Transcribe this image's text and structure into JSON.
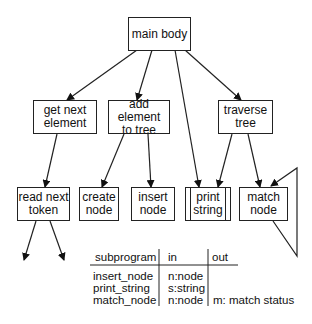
{
  "diagram": {
    "type": "structure chart",
    "nodes": [
      {
        "id": "main_body",
        "label": "main body"
      },
      {
        "id": "get_next_element",
        "label": "get next\nelement"
      },
      {
        "id": "add_element_to_tree",
        "label": "add element\nto tree"
      },
      {
        "id": "traverse_tree",
        "label": "traverse\ntree"
      },
      {
        "id": "read_next_token",
        "label": "read next\ntoken"
      },
      {
        "id": "create_node",
        "label": "create\nnode"
      },
      {
        "id": "insert_node",
        "label": "insert\nnode"
      },
      {
        "id": "print_string",
        "label": "print\nstring",
        "style": "library module (double side bars)"
      },
      {
        "id": "match_node",
        "label": "match\nnode",
        "style": "recursive (loop triangle)"
      }
    ],
    "edges": [
      {
        "from": "main_body",
        "to": "get_next_element"
      },
      {
        "from": "main_body",
        "to": "add_element_to_tree"
      },
      {
        "from": "main_body",
        "to": "print_string"
      },
      {
        "from": "main_body",
        "to": "traverse_tree"
      },
      {
        "from": "get_next_element",
        "to": "read_next_token"
      },
      {
        "from": "add_element_to_tree",
        "to": "create_node"
      },
      {
        "from": "add_element_to_tree",
        "to": "insert_node"
      },
      {
        "from": "traverse_tree",
        "to": "print_string"
      },
      {
        "from": "traverse_tree",
        "to": "match_node"
      },
      {
        "from": "match_node",
        "to": "match_node",
        "kind": "recursion"
      },
      {
        "from": "read_next_token",
        "to": "(unlabeled)"
      },
      {
        "from": "read_next_token",
        "to": "(unlabeled)"
      }
    ]
  },
  "table": {
    "headers": [
      "subprogram",
      "in",
      "out"
    ],
    "rows": [
      [
        "insert_node",
        "n:node",
        ""
      ],
      [
        "print_string",
        "s:string",
        ""
      ],
      [
        "match_node",
        "n:node",
        "m: match status"
      ]
    ]
  }
}
